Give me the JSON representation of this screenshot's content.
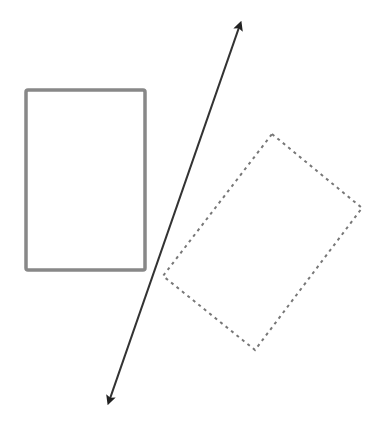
{
  "diagram": {
    "colors": {
      "solid_rect": "#888888",
      "dashed_rect": "#777777",
      "line": "#333333",
      "background": "#ffffff"
    },
    "shapes": {
      "solid_rectangle": {
        "x": 26,
        "y": 90,
        "width": 119,
        "height": 180,
        "style": "solid"
      },
      "dashed_rectangle": {
        "points": [
          [
            272,
            134
          ],
          [
            362,
            208
          ],
          [
            255,
            350
          ],
          [
            163,
            276
          ]
        ],
        "style": "dashed"
      },
      "line_of_reflection": {
        "x1": 243,
        "y1": 16,
        "x2": 106,
        "y2": 410,
        "arrows": "both"
      }
    }
  }
}
